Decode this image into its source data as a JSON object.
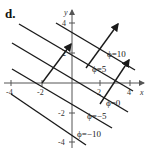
{
  "figure": {
    "part_label": "d.",
    "axes": {
      "x_label": "x",
      "y_label": "y",
      "x_ticks": [
        "-4",
        "-2",
        "2",
        "4"
      ],
      "y_ticks": [
        "4",
        "2",
        "-2",
        "-4"
      ]
    },
    "level_curves": [
      {
        "label": "ϕ=10"
      },
      {
        "label": "ϕ=5"
      },
      {
        "label": "ϕ=0"
      },
      {
        "label": "ϕ=−5"
      },
      {
        "label": "ϕ=−10"
      }
    ],
    "colors": {
      "line": "#1a1a1a",
      "axis": "#555555",
      "background": "#ffffff"
    }
  }
}
